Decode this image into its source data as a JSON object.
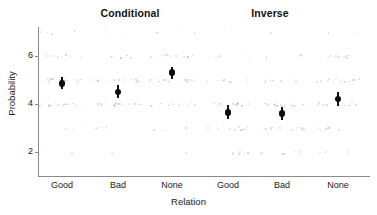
{
  "chart_data": {
    "type": "scatter",
    "title": "",
    "xlabel": "Relation",
    "ylabel": "Probability",
    "ylim": [
      1,
      7.2
    ],
    "yticks": [
      2,
      4,
      6
    ],
    "ytick_labels": [
      "2",
      "4",
      "6"
    ],
    "grid": false,
    "legend": "none",
    "facets": [
      "Conditional",
      "Inverse"
    ],
    "categories": [
      "Good",
      "Bad",
      "None"
    ],
    "series": [
      {
        "name": "Conditional",
        "values": [
          4.85,
          4.5,
          5.3
        ],
        "ci_low": [
          4.6,
          4.25,
          5.05
        ],
        "ci_high": [
          5.1,
          4.78,
          5.55
        ]
      },
      {
        "name": "Inverse",
        "values": [
          3.65,
          3.6,
          4.2
        ],
        "ci_low": [
          3.38,
          3.35,
          3.93
        ],
        "ci_high": [
          3.95,
          3.88,
          4.5
        ]
      }
    ],
    "raw_levels": [
      1,
      2,
      3,
      4,
      5,
      6,
      7
    ],
    "raw_density": {
      "Conditional": {
        "Good": [
          0,
          1,
          4,
          16,
          20,
          9,
          4
        ],
        "Bad": [
          0,
          2,
          5,
          18,
          14,
          6,
          2
        ],
        "None": [
          0,
          1,
          3,
          10,
          17,
          14,
          5
        ]
      },
      "Inverse": {
        "Good": [
          1,
          6,
          12,
          17,
          9,
          5,
          1
        ],
        "Bad": [
          1,
          7,
          13,
          18,
          7,
          3,
          1
        ],
        "None": [
          0,
          3,
          9,
          14,
          13,
          8,
          2
        ]
      }
    }
  },
  "axes": {
    "y_title": "Probability",
    "x_title": "Relation",
    "y_tick_labels": [
      "6",
      "4",
      "2"
    ],
    "x_tick_labels": [
      "Good",
      "Bad",
      "None",
      "Good",
      "Bad",
      "None"
    ]
  },
  "panels": {
    "left_title": "Conditional",
    "right_title": "Inverse"
  }
}
